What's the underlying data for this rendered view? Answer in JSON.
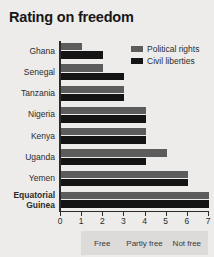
{
  "chart": {
    "title": "Rating on freedom"
  },
  "legend": {
    "position": "top-right",
    "items": [
      {
        "label": "Political rights",
        "color": "#5c5c5c",
        "key": "political_rights"
      },
      {
        "label": "Civil liberties",
        "color": "#141414",
        "key": "civil_liberties"
      }
    ]
  },
  "axis": {
    "ticks": [
      "0",
      "1",
      "2",
      "3",
      "4",
      "5",
      "6",
      "7"
    ]
  },
  "bands": [
    {
      "label": "Free",
      "from": 1,
      "to": 3
    },
    {
      "label": "Partly free",
      "from": 3,
      "to": 5
    },
    {
      "label": "Not free",
      "from": 5,
      "to": 7
    }
  ],
  "chart_data": {
    "type": "bar",
    "orientation": "horizontal",
    "title": "Rating on freedom",
    "xlabel": "",
    "ylabel": "",
    "xlim": [
      0,
      7
    ],
    "xticks": [
      0,
      1,
      2,
      3,
      4,
      5,
      6,
      7
    ],
    "grid": false,
    "legend_position": "top-right",
    "categories": [
      "Ghana",
      "Senegal",
      "Tanzania",
      "Nigeria",
      "Kenya",
      "Uganda",
      "Yemen",
      "Equatorial Guinea"
    ],
    "series": [
      {
        "name": "Political rights",
        "color": "#5c5c5c",
        "values": [
          1,
          2,
          3,
          4,
          4,
          5,
          6,
          7
        ]
      },
      {
        "name": "Civil liberties",
        "color": "#141414",
        "values": [
          2,
          3,
          3,
          4,
          4,
          4,
          6,
          7
        ]
      }
    ],
    "annotations": [
      {
        "label": "Free",
        "range": [
          1,
          3
        ]
      },
      {
        "label": "Partly free",
        "range": [
          3,
          5
        ]
      },
      {
        "label": "Not free",
        "range": [
          5,
          7
        ]
      }
    ],
    "highlighted_category": "Equatorial Guinea"
  }
}
